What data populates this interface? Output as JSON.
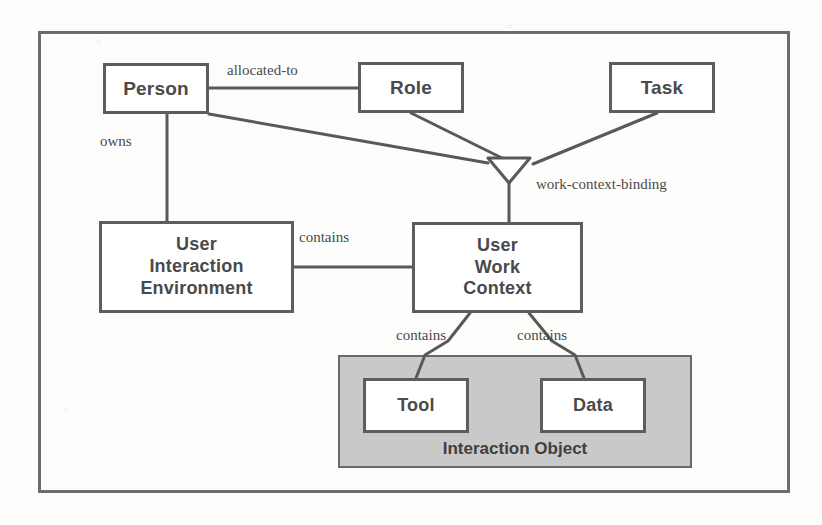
{
  "diagram": {
    "frame": {
      "x": 38,
      "y": 31,
      "w": 752,
      "h": 462
    },
    "colors": {
      "page_background": "#fdfdfc",
      "box_border": "#5d5d5d",
      "box_fill": "#ffffff",
      "frame_border": "#6d6d6d",
      "group_fill": "#c9c9c9",
      "group_border": "#6a6a6a",
      "line": "#595959",
      "text": "#4a4a4a"
    },
    "entities": [
      {
        "id": "person",
        "label": "Person",
        "lines": [
          "Person"
        ],
        "x": 103,
        "y": 63,
        "w": 106,
        "h": 51,
        "font_size": 19
      },
      {
        "id": "role",
        "label": "Role",
        "lines": [
          "Role"
        ],
        "x": 358,
        "y": 62,
        "w": 106,
        "h": 51,
        "font_size": 19
      },
      {
        "id": "task",
        "label": "Task",
        "lines": [
          "Task"
        ],
        "x": 609,
        "y": 62,
        "w": 106,
        "h": 51,
        "font_size": 19
      },
      {
        "id": "uie",
        "label": "User Interaction Environment",
        "lines": [
          "User",
          "Interaction",
          "Environment"
        ],
        "x": 99,
        "y": 221,
        "w": 195,
        "h": 92,
        "font_size": 18
      },
      {
        "id": "uwc",
        "label": "User Work Context",
        "lines": [
          "User",
          "Work",
          "Context"
        ],
        "x": 412,
        "y": 222,
        "w": 171,
        "h": 91,
        "font_size": 18
      },
      {
        "id": "tool",
        "label": "Tool",
        "lines": [
          "Tool"
        ],
        "x": 363,
        "y": 378,
        "w": 106,
        "h": 55,
        "font_size": 18
      },
      {
        "id": "data",
        "label": "Data",
        "lines": [
          "Data"
        ],
        "x": 540,
        "y": 378,
        "w": 106,
        "h": 55,
        "font_size": 18
      }
    ],
    "group": {
      "id": "interaction-object",
      "caption": "Interaction Object",
      "x": 338,
      "y": 355,
      "w": 354,
      "h": 113,
      "caption_y": 437
    },
    "junction": {
      "id": "work-context-binding-junction",
      "shape": "triangle-down",
      "points": "488,158 530,158 509,183"
    },
    "relationships": [
      {
        "id": "allocated-to",
        "label": "allocated-to",
        "x": 227,
        "y": 62,
        "from": "person",
        "to": "role"
      },
      {
        "id": "owns",
        "label": "owns",
        "x": 100,
        "y": 133,
        "from": "person",
        "to": "uie"
      },
      {
        "id": "work-context-binding",
        "label": "work-context-binding",
        "x": 536,
        "y": 176,
        "from": "junction",
        "to": "uwc"
      },
      {
        "id": "contains-uie-uwc",
        "label": "contains",
        "x": 299,
        "y": 229,
        "from": "uie",
        "to": "uwc"
      },
      {
        "id": "contains-uwc-tool",
        "label": "contains",
        "x": 396,
        "y": 327,
        "from": "uwc",
        "to": "tool"
      },
      {
        "id": "contains-uwc-data",
        "label": "contains",
        "x": 517,
        "y": 327,
        "from": "uwc",
        "to": "data"
      }
    ],
    "connectors": [
      {
        "id": "person-role-link",
        "type": "polyline",
        "points": "209,88 358,88"
      },
      {
        "id": "person-junction-link",
        "type": "polyline",
        "points": "209,114 488,163"
      },
      {
        "id": "role-junction-link",
        "type": "polyline",
        "points": "411,113 506,160"
      },
      {
        "id": "task-junction-link",
        "type": "polyline",
        "points": "657,113 533,164"
      },
      {
        "id": "junction-uwc-link",
        "type": "polyline",
        "points": "509,183 509,222"
      },
      {
        "id": "person-uie-link",
        "type": "polyline",
        "points": "167,114 167,221"
      },
      {
        "id": "uie-uwc-link",
        "type": "polyline",
        "points": "294,267 412,267"
      },
      {
        "id": "uwc-tool-link",
        "type": "polyline",
        "points": "470,313 448,341 425,355 416,378"
      },
      {
        "id": "uwc-data-link",
        "type": "polyline",
        "points": "529,313 552,341 575,355 584,378"
      }
    ]
  }
}
